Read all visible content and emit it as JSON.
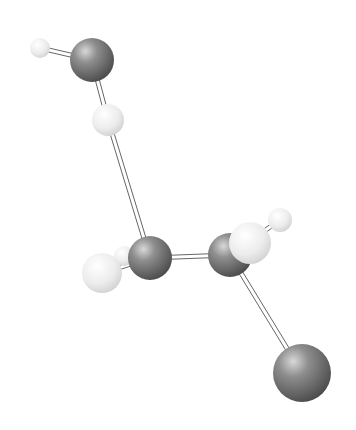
{
  "colors": {
    "background": "#ffffff",
    "heavy_atom": "#7a7a7a",
    "hydrogen": "#ececec",
    "bond": "#666666"
  },
  "atoms": [
    {
      "id": "H1",
      "element": "H",
      "x": 40,
      "y": 48,
      "r": 10
    },
    {
      "id": "O1",
      "element": "O",
      "x": 92,
      "y": 60,
      "r": 22
    },
    {
      "id": "H2",
      "element": "H",
      "x": 108,
      "y": 120,
      "r": 16
    },
    {
      "id": "H3",
      "element": "H",
      "x": 124,
      "y": 256,
      "r": 10
    },
    {
      "id": "C1",
      "element": "C",
      "x": 150,
      "y": 258,
      "r": 22
    },
    {
      "id": "H4",
      "element": "H",
      "x": 102,
      "y": 273,
      "r": 20
    },
    {
      "id": "C2",
      "element": "C",
      "x": 230,
      "y": 255,
      "r": 22
    },
    {
      "id": "H6",
      "element": "H",
      "x": 280,
      "y": 220,
      "r": 12
    },
    {
      "id": "H5",
      "element": "H",
      "x": 250,
      "y": 243,
      "r": 21
    },
    {
      "id": "O2",
      "element": "O",
      "x": 302,
      "y": 373,
      "r": 29
    }
  ],
  "bonds": [
    [
      "H1",
      "O1"
    ],
    [
      "O1",
      "H2"
    ],
    [
      "H2",
      "C1"
    ],
    [
      "C1",
      "H3"
    ],
    [
      "C1",
      "H4"
    ],
    [
      "C1",
      "C2"
    ],
    [
      "C2",
      "H5"
    ],
    [
      "C2",
      "H6"
    ],
    [
      "C2",
      "O2"
    ]
  ]
}
